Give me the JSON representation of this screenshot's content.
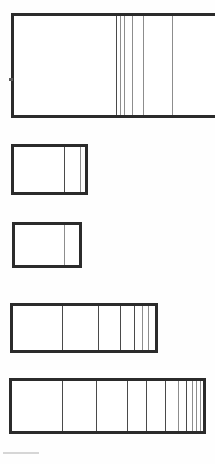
{
  "figure": {
    "title": "",
    "caption": "",
    "background_color": "#fefefe",
    "ink_color": "#2b2b2b",
    "partition_color": "#4a4a4a",
    "faint_partition_color": "#8d8d8d",
    "width_px": 215,
    "height_px": 464
  },
  "chart_data": {
    "type": "bar",
    "title": "",
    "subtitle": "",
    "xlabel": "",
    "ylabel": "",
    "grid": false,
    "legend_position": "none",
    "orientation": "horizontal",
    "categories": [
      "Row 1",
      "Row 2",
      "Row 3",
      "Row 4",
      "Row 5"
    ],
    "values": [
      100,
      39,
      35,
      74,
      97
    ],
    "axis_note": "lengths expressed as percent of the 215 px drawing width",
    "rows": [
      {
        "name": "Row 1",
        "index": 1,
        "x_start_px": 11,
        "x_end_px": 215,
        "y_top_px": 13,
        "y_bottom_px": 118,
        "length_px": 204,
        "length_pct": 100,
        "clipped_right": true,
        "border_px": 3,
        "segment_count": 6,
        "partitions_px": [
          116,
          120,
          124,
          132,
          143,
          172
        ],
        "partition_weights": [
          "strong",
          "faint",
          "faint",
          "faint",
          "faint",
          "faint"
        ],
        "segment_widths_px": [
          105,
          4,
          4,
          8,
          11,
          29
        ],
        "segment_values": [
          51.5,
          2.0,
          2.0,
          3.9,
          5.4,
          35.2
        ]
      },
      {
        "name": "Row 2",
        "index": 2,
        "x_start_px": 11,
        "x_end_px": 88,
        "y_top_px": 144,
        "y_bottom_px": 195,
        "length_px": 77,
        "length_pct": 37.7,
        "clipped_right": false,
        "border_px": 3,
        "segment_count": 3,
        "partitions_px": [
          64,
          80
        ],
        "partition_weights": [
          "strong",
          "faint"
        ],
        "segment_widths_px": [
          53,
          16,
          8
        ],
        "segment_values": [
          68.8,
          20.8,
          10.4
        ]
      },
      {
        "name": "Row 3",
        "index": 3,
        "x_start_px": 12,
        "x_end_px": 82,
        "y_top_px": 222,
        "y_bottom_px": 268,
        "length_px": 70,
        "length_pct": 34.3,
        "clipped_right": false,
        "border_px": 3,
        "segment_count": 2,
        "partitions_px": [
          64
        ],
        "partition_weights": [
          "faint"
        ],
        "segment_widths_px": [
          52,
          18
        ],
        "segment_values": [
          74.3,
          25.7
        ]
      },
      {
        "name": "Row 4",
        "index": 4,
        "x_start_px": 10,
        "x_end_px": 158,
        "y_top_px": 303,
        "y_bottom_px": 353,
        "length_px": 148,
        "length_pct": 72.5,
        "clipped_right": false,
        "border_px": 3,
        "segment_count": 7,
        "partitions_px": [
          62,
          98,
          120,
          134,
          142,
          148
        ],
        "partition_weights": [
          "strong",
          "strong",
          "strong",
          "strong",
          "faint",
          "faint"
        ],
        "segment_widths_px": [
          52,
          36,
          22,
          14,
          8,
          6,
          10
        ],
        "segment_values": [
          35.1,
          24.3,
          14.9,
          9.5,
          5.4,
          4.1,
          6.8
        ]
      },
      {
        "name": "Row 5",
        "index": 5,
        "x_start_px": 9,
        "x_end_px": 206,
        "y_top_px": 378,
        "y_bottom_px": 434,
        "length_px": 197,
        "length_pct": 96.6,
        "clipped_right": false,
        "border_px": 3,
        "segment_count": 11,
        "partitions_px": [
          62,
          96,
          127,
          146,
          165,
          178,
          186,
          192,
          196,
          200
        ],
        "partition_weights": [
          "strong",
          "strong",
          "strong",
          "strong",
          "strong",
          "faint",
          "strong",
          "faint",
          "faint",
          "faint"
        ],
        "segment_widths_px": [
          53,
          34,
          31,
          19,
          19,
          13,
          8,
          6,
          4,
          4,
          6
        ],
        "segment_values": [
          26.9,
          17.3,
          15.7,
          9.6,
          9.6,
          6.6,
          4.1,
          3.0,
          2.0,
          2.0,
          3.0
        ]
      }
    ]
  },
  "marks": {
    "edge_tick": {
      "x_px": 9,
      "y_px": 78,
      "width_px": 4,
      "height_px": 3
    },
    "baseline_smudge": {
      "x_px": 3,
      "y_px": 452,
      "width_px": 36,
      "height_px": 2
    }
  }
}
